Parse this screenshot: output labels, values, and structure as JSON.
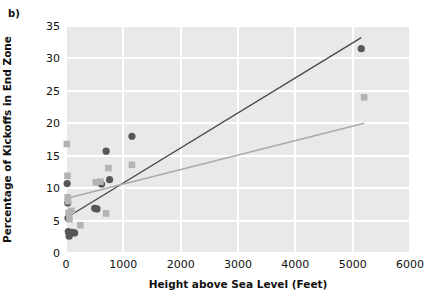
{
  "panel": {
    "label": "b)"
  },
  "colors": {
    "plot_background": "#e9e9e9",
    "gridline": "#ffffff",
    "series_dark": "#575757",
    "series_light": "#b4b4b4",
    "trend_dark": "#4a4a4a",
    "trend_light": "#aaaaaa",
    "text": "#111111"
  },
  "chart_data": {
    "type": "scatter",
    "title": "",
    "xlabel": "Height above Sea Level (Feet)",
    "ylabel": "Percentage of Kickoffs in End Zone",
    "xlim": [
      0,
      6000
    ],
    "ylim": [
      0,
      35
    ],
    "xticks": [
      0,
      1000,
      2000,
      3000,
      4000,
      5000,
      6000
    ],
    "yticks": [
      0,
      5,
      10,
      15,
      20,
      25,
      30,
      35
    ],
    "xtick_labels": [
      "0",
      "1000",
      "2000",
      "3000",
      "4000",
      "5000",
      "6000"
    ],
    "ytick_labels": [
      "0",
      "5",
      "10",
      "15",
      "20",
      "25",
      "30",
      "35"
    ],
    "grid": true,
    "legend": "none",
    "series": [
      {
        "name": "dark-circles",
        "marker": "circle",
        "color": "#575757",
        "points": [
          [
            20,
            10.7
          ],
          [
            30,
            7.7
          ],
          [
            35,
            5.4
          ],
          [
            40,
            3.3
          ],
          [
            55,
            2.6
          ],
          [
            60,
            2.9
          ],
          [
            105,
            3.2
          ],
          [
            150,
            3.1
          ],
          [
            500,
            6.9
          ],
          [
            540,
            6.8
          ],
          [
            620,
            10.6
          ],
          [
            700,
            15.7
          ],
          [
            760,
            11.3
          ],
          [
            1150,
            18.0
          ],
          [
            5150,
            31.5
          ]
        ]
      },
      {
        "name": "light-squares",
        "marker": "square",
        "color": "#b4b4b4",
        "points": [
          [
            15,
            16.8
          ],
          [
            25,
            11.9
          ],
          [
            30,
            8.6
          ],
          [
            35,
            8.0
          ],
          [
            45,
            6.2
          ],
          [
            60,
            5.2
          ],
          [
            95,
            6.5
          ],
          [
            250,
            4.3
          ],
          [
            520,
            10.9
          ],
          [
            600,
            11.0
          ],
          [
            700,
            6.1
          ],
          [
            740,
            13.1
          ],
          [
            1150,
            13.6
          ],
          [
            5200,
            24.0
          ]
        ]
      }
    ],
    "trend_lines": [
      {
        "name": "dark-trend",
        "color": "#4a4a4a",
        "x0": 0,
        "y0": 5.4,
        "x1": 5150,
        "y1": 33.2
      },
      {
        "name": "light-trend",
        "color": "#aaaaaa",
        "x0": 0,
        "y0": 8.4,
        "x1": 5200,
        "y1": 20.0
      }
    ]
  }
}
